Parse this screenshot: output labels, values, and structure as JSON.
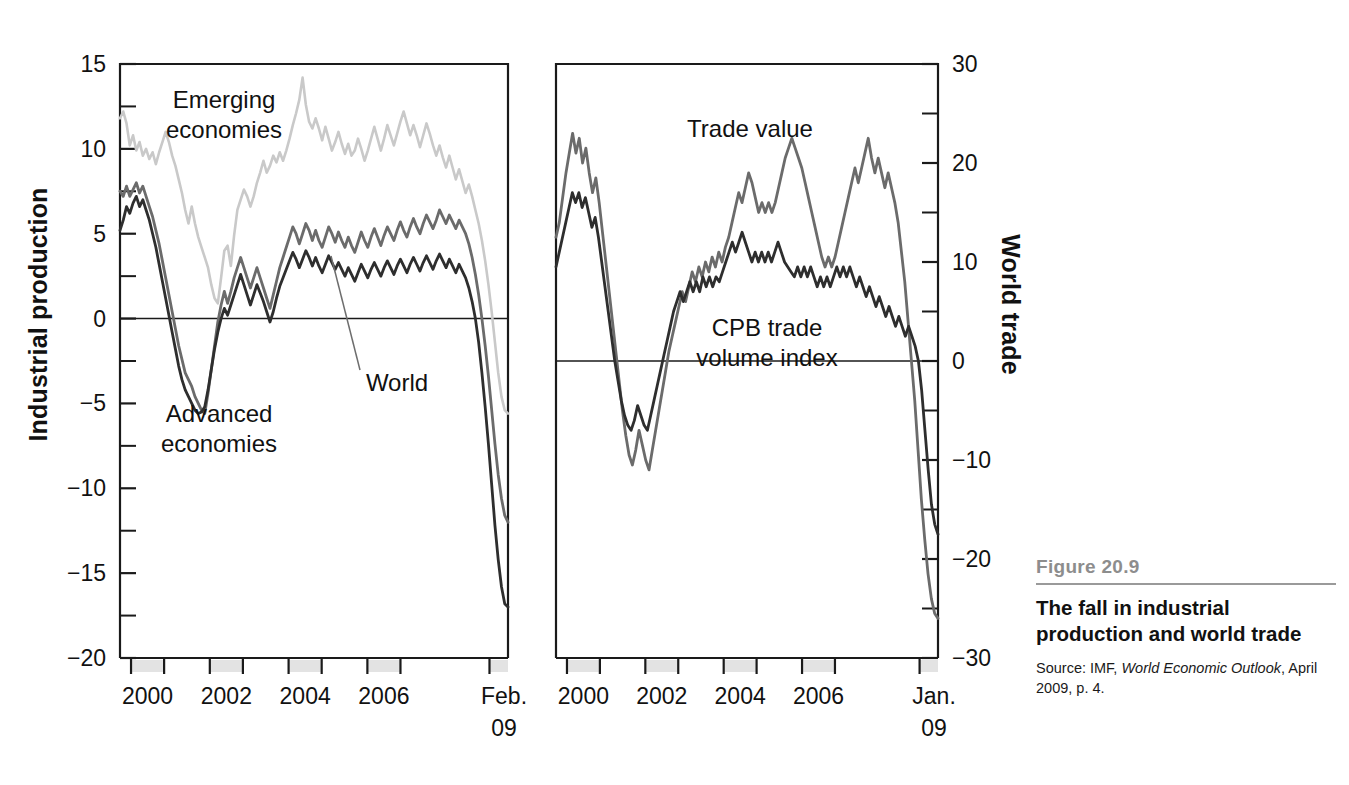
{
  "caption": {
    "figure_number": "Figure 20.9",
    "title": "The fall in industrial production and world trade",
    "source_prefix": "Source: IMF, ",
    "source_italic": "World Economic Outlook",
    "source_suffix": ", April 2009, p. 4."
  },
  "chart_data": [
    {
      "id": "industrial-production",
      "type": "line",
      "title": "",
      "xlabel": "",
      "ylabel": "Industrial production",
      "ylim": [
        -20,
        15
      ],
      "ytick_major": [
        15,
        10,
        5,
        0,
        -5,
        -10,
        -15,
        -20
      ],
      "ytick_minor": [
        12.5,
        7.5,
        2.5,
        -2.5,
        -7.5,
        -12.5,
        -17.5
      ],
      "xtick_labels": [
        "2000",
        "2002",
        "2004",
        "2006",
        "Feb.",
        "09"
      ],
      "xtick_years": [
        2000,
        2002,
        2004,
        2006,
        2009.1
      ],
      "xlim": [
        1999.3,
        2009.15
      ],
      "grid": false,
      "legend": "inline-annotations",
      "annotations": [
        {
          "text": "Emerging economies",
          "series": "emerging"
        },
        {
          "text": "Advanced economies",
          "series": "advanced"
        },
        {
          "text": "World",
          "series": "world",
          "leader_line": true
        }
      ],
      "series": [
        {
          "name": "Emerging economies",
          "color": "#c9c9c9",
          "values": [
            11.8,
            12.2,
            11.5,
            10.2,
            10.8,
            9.9,
            10.4,
            9.6,
            10.0,
            9.4,
            9.8,
            9.1,
            9.8,
            10.4,
            11.0,
            10.4,
            9.6,
            9.0,
            8.2,
            7.4,
            6.4,
            5.6,
            6.6,
            5.6,
            4.8,
            4.2,
            3.6,
            3.0,
            2.0,
            1.2,
            0.9,
            2.4,
            4.0,
            4.3,
            3.1,
            4.9,
            6.4,
            7.0,
            7.6,
            7.2,
            6.6,
            7.2,
            8.0,
            8.6,
            9.3,
            8.6,
            9.0,
            9.6,
            9.2,
            9.8,
            9.3,
            9.9,
            10.6,
            11.4,
            12.1,
            12.9,
            14.2,
            12.6,
            11.6,
            11.2,
            11.8,
            11.2,
            10.5,
            11.3,
            10.6,
            9.9,
            10.4,
            11.0,
            10.3,
            9.7,
            10.3,
            9.6,
            9.9,
            10.6,
            10.0,
            9.3,
            9.9,
            10.6,
            11.3,
            10.6,
            9.9,
            10.6,
            11.4,
            10.8,
            10.2,
            10.9,
            11.6,
            12.2,
            11.5,
            10.8,
            11.4,
            10.8,
            10.1,
            10.8,
            11.5,
            10.9,
            10.2,
            9.6,
            10.2,
            9.5,
            8.9,
            9.6,
            8.9,
            8.2,
            8.8,
            8.1,
            7.4,
            7.9,
            7.2,
            6.4,
            5.6,
            4.6,
            3.4,
            2.0,
            0.4,
            -1.4,
            -3.2,
            -4.6,
            -5.4,
            -5.6
          ]
        },
        {
          "name": "World",
          "color": "#6b6b6b",
          "values": [
            7.5,
            7.2,
            7.8,
            7.2,
            7.6,
            8.0,
            7.4,
            7.8,
            7.2,
            6.6,
            6.0,
            5.2,
            4.4,
            3.4,
            2.4,
            1.4,
            0.4,
            -0.6,
            -1.6,
            -2.4,
            -3.2,
            -3.6,
            -4.0,
            -4.6,
            -5.0,
            -5.4,
            -5.6,
            -4.4,
            -3.0,
            -1.6,
            -0.2,
            0.8,
            1.6,
            0.9,
            1.6,
            2.4,
            3.0,
            3.6,
            3.0,
            2.4,
            1.8,
            2.4,
            3.0,
            2.4,
            1.8,
            1.2,
            0.6,
            1.4,
            2.2,
            3.0,
            3.6,
            4.2,
            4.8,
            5.4,
            5.0,
            4.4,
            5.0,
            5.6,
            5.2,
            4.6,
            5.2,
            4.6,
            4.2,
            4.8,
            5.4,
            5.0,
            4.5,
            5.1,
            4.6,
            4.2,
            4.8,
            4.3,
            3.9,
            4.5,
            5.1,
            4.6,
            4.2,
            4.8,
            5.3,
            4.8,
            4.3,
            4.9,
            5.4,
            5.0,
            4.6,
            5.2,
            5.7,
            5.2,
            4.8,
            5.4,
            5.9,
            5.4,
            5.0,
            5.6,
            6.1,
            5.7,
            5.3,
            5.8,
            6.4,
            6.0,
            5.6,
            6.1,
            5.7,
            5.3,
            5.8,
            5.4,
            5.0,
            4.4,
            3.6,
            2.6,
            1.4,
            0.0,
            -1.6,
            -3.4,
            -5.4,
            -7.4,
            -9.2,
            -10.6,
            -11.6,
            -12.0
          ]
        },
        {
          "name": "Advanced economies",
          "color": "#2e2e2e",
          "values": [
            5.2,
            5.8,
            6.6,
            6.2,
            6.8,
            7.2,
            6.6,
            7.0,
            6.4,
            5.8,
            5.0,
            4.2,
            3.2,
            2.2,
            1.2,
            0.2,
            -0.8,
            -1.8,
            -2.8,
            -3.6,
            -4.2,
            -4.6,
            -5.0,
            -5.4,
            -5.6,
            -5.5,
            -5.2,
            -4.2,
            -3.0,
            -1.8,
            -0.8,
            0.0,
            0.6,
            0.2,
            0.8,
            1.4,
            2.0,
            2.6,
            2.0,
            1.4,
            0.8,
            1.4,
            2.0,
            1.5,
            1.0,
            0.4,
            -0.2,
            0.4,
            1.2,
            1.9,
            2.4,
            2.9,
            3.4,
            3.9,
            3.5,
            3.0,
            3.5,
            4.0,
            3.6,
            3.1,
            3.6,
            3.1,
            2.7,
            3.2,
            3.7,
            3.3,
            2.9,
            3.3,
            2.9,
            2.5,
            3.0,
            2.6,
            2.2,
            2.7,
            3.2,
            2.8,
            2.4,
            2.9,
            3.3,
            2.9,
            2.5,
            3.0,
            3.4,
            3.0,
            2.6,
            3.1,
            3.5,
            3.1,
            2.7,
            3.2,
            3.6,
            3.2,
            2.8,
            3.3,
            3.7,
            3.3,
            2.9,
            3.4,
            3.8,
            3.4,
            3.0,
            3.5,
            3.1,
            2.7,
            3.2,
            2.8,
            2.4,
            1.8,
            1.0,
            0.0,
            -1.4,
            -3.2,
            -5.2,
            -7.4,
            -9.8,
            -12.2,
            -14.2,
            -15.8,
            -16.8,
            -17.0
          ]
        }
      ]
    },
    {
      "id": "world-trade",
      "type": "line",
      "title": "",
      "xlabel": "",
      "ylabel": "World trade",
      "ylim": [
        -30,
        30
      ],
      "ytick_major": [
        30,
        20,
        10,
        0,
        -10,
        -20,
        -30
      ],
      "ytick_minor": [
        25,
        15,
        5,
        -5,
        -15,
        -25
      ],
      "xtick_labels": [
        "2000",
        "2002",
        "2004",
        "2006",
        "Jan.",
        "09"
      ],
      "xtick_years": [
        2000,
        2002,
        2004,
        2006,
        2009.0
      ],
      "xlim": [
        1999.3,
        2009.05
      ],
      "grid": false,
      "legend": "inline-annotations",
      "annotations": [
        {
          "text": "Trade value",
          "series": "trade-value"
        },
        {
          "text": "CPB trade volume index",
          "series": "cpb-trade-volume"
        }
      ],
      "series": [
        {
          "name": "Trade value",
          "color": "#6b6b6b",
          "values": [
            12.5,
            14.0,
            16.5,
            19.0,
            21.0,
            23.0,
            21.0,
            22.5,
            20.0,
            21.5,
            19.0,
            17.0,
            18.5,
            16.0,
            13.0,
            10.0,
            7.0,
            4.0,
            1.0,
            -2.0,
            -5.0,
            -7.5,
            -9.5,
            -10.5,
            -9.0,
            -7.0,
            -8.5,
            -10.0,
            -11.0,
            -9.0,
            -7.0,
            -5.0,
            -3.0,
            -1.0,
            1.0,
            2.5,
            4.0,
            5.5,
            7.0,
            6.0,
            7.5,
            9.0,
            8.0,
            9.5,
            8.5,
            10.0,
            9.0,
            10.5,
            9.5,
            11.0,
            10.0,
            11.5,
            12.5,
            14.0,
            15.5,
            17.0,
            16.0,
            17.5,
            19.0,
            18.0,
            16.5,
            15.0,
            16.0,
            15.0,
            16.0,
            15.0,
            16.0,
            17.5,
            19.0,
            20.5,
            21.5,
            22.5,
            21.5,
            20.5,
            19.5,
            18.0,
            16.5,
            15.0,
            13.5,
            12.0,
            10.5,
            9.5,
            10.5,
            9.5,
            10.5,
            12.0,
            13.5,
            15.0,
            16.5,
            18.0,
            19.5,
            18.0,
            19.5,
            21.0,
            22.5,
            20.5,
            19.0,
            20.5,
            19.0,
            17.5,
            19.0,
            17.5,
            16.0,
            14.0,
            11.0,
            8.0,
            4.0,
            0.0,
            -4.0,
            -9.0,
            -14.0,
            -18.0,
            -21.5,
            -24.0,
            -25.5,
            -26.0
          ]
        },
        {
          "name": "CPB trade volume index",
          "color": "#2e2e2e",
          "values": [
            9.5,
            11.0,
            12.5,
            14.0,
            15.5,
            17.0,
            16.0,
            17.0,
            15.5,
            16.5,
            15.0,
            13.5,
            14.5,
            12.5,
            10.0,
            7.5,
            5.0,
            2.5,
            0.0,
            -2.0,
            -4.0,
            -5.5,
            -6.5,
            -7.0,
            -6.0,
            -4.5,
            -5.5,
            -6.5,
            -7.0,
            -5.5,
            -4.0,
            -2.5,
            -1.0,
            0.5,
            2.0,
            3.5,
            5.0,
            6.0,
            7.0,
            6.0,
            7.0,
            8.0,
            7.0,
            8.0,
            7.0,
            8.5,
            7.5,
            8.5,
            7.5,
            8.5,
            8.0,
            9.0,
            10.0,
            11.0,
            12.0,
            11.0,
            12.0,
            13.0,
            12.0,
            11.0,
            10.0,
            11.0,
            10.0,
            11.0,
            10.0,
            11.0,
            10.0,
            11.0,
            12.0,
            11.0,
            10.0,
            9.5,
            9.0,
            8.5,
            9.5,
            8.5,
            9.5,
            8.5,
            9.5,
            8.5,
            7.5,
            8.5,
            7.5,
            8.5,
            7.5,
            8.5,
            9.5,
            8.5,
            9.5,
            8.5,
            9.5,
            8.5,
            7.5,
            8.5,
            7.5,
            6.5,
            7.5,
            6.5,
            5.5,
            6.5,
            5.5,
            4.5,
            5.5,
            4.5,
            3.5,
            4.5,
            3.5,
            2.5,
            3.5,
            2.5,
            1.5,
            0.0,
            -3.0,
            -7.0,
            -11.0,
            -14.5,
            -16.5,
            -17.5
          ]
        }
      ]
    }
  ]
}
